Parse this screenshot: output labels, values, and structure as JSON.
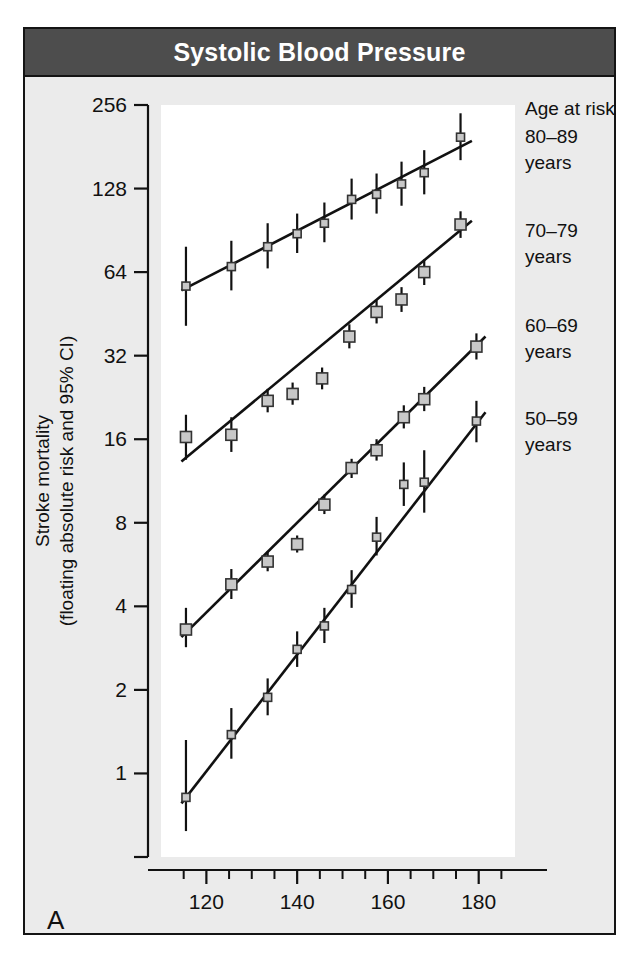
{
  "figure": {
    "title": "Systolic Blood Pressure",
    "panel_label": "A",
    "title_bar_color": "#4d4d4d",
    "background_color": "#ebebeb",
    "plot_background_color": "#ffffff",
    "marker_fill_color": "#c8c8c8",
    "marker_stroke_color": "#333333",
    "line_color": "#111111"
  },
  "legend": {
    "heading": "Age at risk",
    "items": [
      {
        "label_line1": "80–89",
        "label_line2": "years"
      },
      {
        "label_line1": "70–79",
        "label_line2": "years"
      },
      {
        "label_line1": "60–69",
        "label_line2": "years"
      },
      {
        "label_line1": "50–59",
        "label_line2": "years"
      }
    ]
  },
  "chart_data": {
    "type": "scatter",
    "title": "Systolic Blood Pressure",
    "xlabel": "Usual systolic blood pressure (mm Hg)",
    "ylabel": "Stroke mortality (floating absolute risk and 95% CI)",
    "xlabel_line1": "Usual systolic blood",
    "xlabel_line2": "pressure (mm Hg)",
    "ylabel_line1": "Stroke mortality",
    "ylabel_line2": "(floating absolute risk and 95% CI)",
    "yscale": "log2",
    "xlim": [
      110,
      188
    ],
    "ylim": [
      0.5,
      256
    ],
    "yticks": [
      256,
      128,
      64,
      32,
      16,
      8,
      4,
      2,
      1
    ],
    "ytick_labels": [
      "256",
      "128",
      "64",
      "32",
      "16",
      "8",
      "4",
      "2",
      "1"
    ],
    "yticks_unlabeled": [
      0.5
    ],
    "xticks": [
      120,
      140,
      160,
      180
    ],
    "xtick_labels": [
      "120",
      "140",
      "160",
      "180"
    ],
    "xticks_minor": [
      115,
      125,
      130,
      135,
      145,
      150,
      155,
      165,
      170,
      175,
      185
    ],
    "grid": false,
    "legend_position": "right",
    "series": [
      {
        "name": "80–89 years",
        "marker_size": "small",
        "points": [
          {
            "x": 115.5,
            "y": 57.0,
            "ci_low": 41.0,
            "ci_high": 79.0
          },
          {
            "x": 125.5,
            "y": 67.0,
            "ci_low": 55.0,
            "ci_high": 83.0
          },
          {
            "x": 133.5,
            "y": 79.0,
            "ci_low": 66.0,
            "ci_high": 96.0
          },
          {
            "x": 140.0,
            "y": 88.0,
            "ci_low": 75.0,
            "ci_high": 104.0
          },
          {
            "x": 146.0,
            "y": 96.0,
            "ci_low": 82.0,
            "ci_high": 114.0
          },
          {
            "x": 152.0,
            "y": 117.0,
            "ci_low": 99.0,
            "ci_high": 139.0
          },
          {
            "x": 157.5,
            "y": 122.0,
            "ci_low": 104.0,
            "ci_high": 145.0
          },
          {
            "x": 163.0,
            "y": 133.0,
            "ci_low": 111.0,
            "ci_high": 160.0
          },
          {
            "x": 168.0,
            "y": 146.0,
            "ci_low": 122.0,
            "ci_high": 176.0
          },
          {
            "x": 176.0,
            "y": 196.0,
            "ci_low": 162.0,
            "ci_high": 239.0
          }
        ],
        "fit_line": {
          "x1": 114.5,
          "y1": 55.0,
          "x2": 178.5,
          "y2": 190.0
        }
      },
      {
        "name": "70–79 years",
        "marker_size": "medium",
        "points": [
          {
            "x": 115.5,
            "y": 16.3,
            "ci_low": 13.5,
            "ci_high": 19.6
          },
          {
            "x": 125.5,
            "y": 16.6,
            "ci_low": 14.4,
            "ci_high": 19.2
          },
          {
            "x": 133.5,
            "y": 22.0,
            "ci_low": 20.0,
            "ci_high": 24.3
          },
          {
            "x": 139.0,
            "y": 23.3,
            "ci_low": 21.3,
            "ci_high": 25.6
          },
          {
            "x": 145.5,
            "y": 26.5,
            "ci_low": 24.2,
            "ci_high": 29.0
          },
          {
            "x": 151.5,
            "y": 37.5,
            "ci_low": 34.0,
            "ci_high": 41.5
          },
          {
            "x": 157.5,
            "y": 46.0,
            "ci_low": 41.8,
            "ci_high": 50.7
          },
          {
            "x": 163.0,
            "y": 51.0,
            "ci_low": 46.0,
            "ci_high": 56.5
          },
          {
            "x": 168.0,
            "y": 64.0,
            "ci_low": 57.5,
            "ci_high": 71.0
          },
          {
            "x": 176.0,
            "y": 95.0,
            "ci_low": 85.0,
            "ci_high": 106.0
          }
        ],
        "fit_line": {
          "x1": 114.5,
          "y1": 13.3,
          "x2": 178.5,
          "y2": 98.0
        }
      },
      {
        "name": "60–69 years",
        "marker_size": "medium",
        "points": [
          {
            "x": 115.5,
            "y": 3.3,
            "ci_low": 2.85,
            "ci_high": 3.95
          },
          {
            "x": 125.5,
            "y": 4.8,
            "ci_low": 4.25,
            "ci_high": 5.45
          },
          {
            "x": 133.5,
            "y": 5.8,
            "ci_low": 5.35,
            "ci_high": 6.3
          },
          {
            "x": 140.0,
            "y": 6.7,
            "ci_low": 6.25,
            "ci_high": 7.2
          },
          {
            "x": 146.0,
            "y": 9.3,
            "ci_low": 8.6,
            "ci_high": 10.1
          },
          {
            "x": 152.0,
            "y": 12.6,
            "ci_low": 11.6,
            "ci_high": 13.6
          },
          {
            "x": 157.5,
            "y": 14.6,
            "ci_low": 13.4,
            "ci_high": 16.0
          },
          {
            "x": 163.5,
            "y": 19.2,
            "ci_low": 17.5,
            "ci_high": 21.2
          },
          {
            "x": 168.0,
            "y": 22.3,
            "ci_low": 20.2,
            "ci_high": 24.7
          },
          {
            "x": 179.5,
            "y": 34.5,
            "ci_low": 31.0,
            "ci_high": 38.5
          }
        ],
        "fit_line": {
          "x1": 114.5,
          "y1": 3.1,
          "x2": 181.5,
          "y2": 37.5
        }
      },
      {
        "name": "50–59 years",
        "marker_size": "small",
        "points": [
          {
            "x": 115.5,
            "y": 0.82,
            "ci_low": 0.62,
            "ci_high": 1.32
          },
          {
            "x": 125.5,
            "y": 1.38,
            "ci_low": 1.13,
            "ci_high": 1.72
          },
          {
            "x": 133.5,
            "y": 1.88,
            "ci_low": 1.62,
            "ci_high": 2.2
          },
          {
            "x": 140.0,
            "y": 2.8,
            "ci_low": 2.42,
            "ci_high": 3.25
          },
          {
            "x": 146.0,
            "y": 3.4,
            "ci_low": 2.95,
            "ci_high": 3.95
          },
          {
            "x": 152.0,
            "y": 4.6,
            "ci_low": 3.95,
            "ci_high": 5.4
          },
          {
            "x": 157.5,
            "y": 7.1,
            "ci_low": 6.1,
            "ci_high": 8.4
          },
          {
            "x": 163.5,
            "y": 11.0,
            "ci_low": 9.2,
            "ci_high": 13.2
          },
          {
            "x": 168.0,
            "y": 11.2,
            "ci_low": 8.7,
            "ci_high": 14.6
          },
          {
            "x": 179.5,
            "y": 18.6,
            "ci_low": 15.6,
            "ci_high": 22.0
          }
        ],
        "fit_line": {
          "x1": 114.5,
          "y1": 0.78,
          "x2": 181.5,
          "y2": 20.0
        }
      }
    ]
  }
}
